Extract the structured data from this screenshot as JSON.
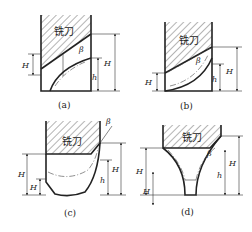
{
  "figure": {
    "panels": [
      {
        "id": "a",
        "caption": "(a)",
        "cutter_label": "铣刀",
        "labels": {
          "H1": "H",
          "H1_sub": "1",
          "H2": "H",
          "H2_sub": "2",
          "h": "h",
          "beta": "β"
        }
      },
      {
        "id": "b",
        "caption": "(b)",
        "cutter_label": "铣刀",
        "labels": {
          "H1": "H",
          "H1_sub": "1",
          "H2": "H",
          "H2_sub": "2",
          "h": "h",
          "beta": "β"
        }
      },
      {
        "id": "c",
        "caption": "(c)",
        "cutter_label": "铣刀",
        "labels": {
          "H": "H",
          "H1": "H",
          "H1_sub": "1",
          "H2": "H",
          "H2_sub": "1",
          "h": "h",
          "beta": "β"
        }
      },
      {
        "id": "d",
        "caption": "(d)",
        "cutter_label": "铣刀",
        "labels": {
          "H": "H",
          "H1": "H",
          "H1_sub": "1",
          "H2": "H",
          "H2_sub": "2",
          "h": "h",
          "beta": "β"
        }
      }
    ]
  }
}
